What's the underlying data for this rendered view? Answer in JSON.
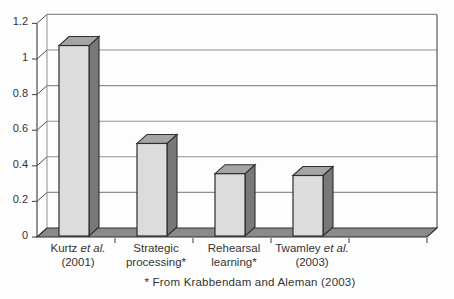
{
  "figure": {
    "background": "#fdfdfd"
  },
  "chart_data": {
    "type": "bar",
    "style": "3d-column",
    "title": "",
    "xlabel": "",
    "ylabel": "",
    "ylim": [
      0,
      1.2
    ],
    "yticks": [
      0,
      0.2,
      0.4,
      0.6,
      0.8,
      1,
      1.2
    ],
    "ytick_labels": [
      "0",
      "0.2",
      "0.4",
      "0.6",
      "0.8",
      "1",
      "1.2"
    ],
    "grid": true,
    "legend": "none",
    "num_slots": 5,
    "categories": [
      {
        "id": "kurtz-2001",
        "line1": [
          {
            "t": "Kurtz "
          },
          {
            "t": "et al.",
            "i": true
          }
        ],
        "line2": "(2001)"
      },
      {
        "id": "strategic-processing",
        "line1": [
          {
            "t": "Strategic"
          }
        ],
        "line2": "processing*"
      },
      {
        "id": "rehearsal-learning",
        "line1": [
          {
            "t": "Rehearsal"
          }
        ],
        "line2": "learning*"
      },
      {
        "id": "twamley-2003",
        "line1": [
          {
            "t": "Twamley "
          },
          {
            "t": "et al.",
            "i": true
          }
        ],
        "line2": "(2003)"
      }
    ],
    "values": [
      1.07,
      0.52,
      0.35,
      0.34
    ],
    "footnote": "* From Krabbendam and Aleman (2003)",
    "colors": {
      "bar_front": "#dcdcdc",
      "bar_side": "#787878",
      "bar_top": "#a5a5a5",
      "floor": "#8a8a8a",
      "outline": "#2e2e2e",
      "gridline": "#8f8f8f",
      "axis": "#4c4c4c",
      "text": "#333333"
    }
  }
}
